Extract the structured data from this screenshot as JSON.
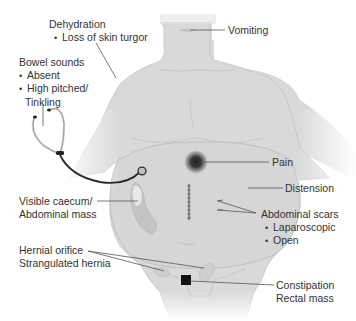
{
  "figure": {
    "colors": {
      "body_fill": "#d9d9d9",
      "body_outline": "#bdbdbd",
      "leader_line": "#555555",
      "pain_center": "#2a2a2a",
      "stethoscope": "#2b2b2b",
      "rectal_mass": "#111111"
    }
  },
  "labels": {
    "dehydration": {
      "title": "Dehydration",
      "items": [
        "Loss of skin turgor"
      ]
    },
    "vomiting": {
      "title": "Vomiting"
    },
    "bowel_sounds": {
      "title": "Bowel sounds",
      "items": [
        "Absent",
        "High pitched/",
        "Tinkling"
      ]
    },
    "pain": {
      "title": "Pain"
    },
    "distension": {
      "title": "Distension"
    },
    "visible_caecum": {
      "line1": "Visible caecum/",
      "line2": "Abdominal mass"
    },
    "abdominal_scars": {
      "title": "Abdominal scars",
      "items": [
        "Laparoscopic",
        "Open"
      ]
    },
    "hernial": {
      "line1": "Hernial orifice",
      "line2": "Strangulated hernia"
    },
    "constipation": {
      "line1": "Constipation",
      "line2": "Rectal mass"
    }
  },
  "icons": {
    "stethoscope": "stethoscope-icon",
    "pain_spot": "pain-spot",
    "midline_scar": "midline-scar",
    "rectal_mass": "rectal-mass-marker"
  }
}
